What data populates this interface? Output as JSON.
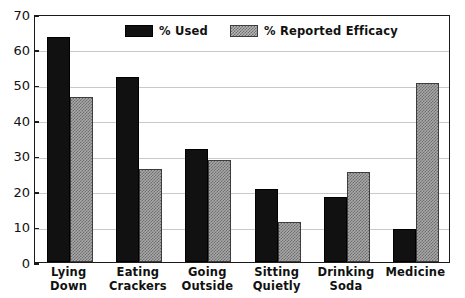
{
  "chart_data": {
    "type": "bar",
    "title": "",
    "subtitle": "",
    "xlabel": "",
    "ylabel": "",
    "ylim": [
      0,
      70
    ],
    "yticks": [
      0,
      10,
      20,
      30,
      40,
      50,
      60,
      70
    ],
    "ytick_labels": [
      "0",
      "10",
      "20",
      "30",
      "40",
      "50",
      "60",
      "70"
    ],
    "grid": true,
    "grid_axis": "y",
    "legend_position": "top-center-inside",
    "categories": [
      "Lying Down",
      "Eating Crackers",
      "Going Outside",
      "Sitting Quietly",
      "Drinking Soda",
      "Medicine"
    ],
    "category_lines": [
      [
        "Lying",
        "Down"
      ],
      [
        "Eating",
        "Crackers"
      ],
      [
        "Going",
        "Outside"
      ],
      [
        "Sitting",
        "Quietly"
      ],
      [
        "Drinking",
        "Soda"
      ],
      [
        "Medicine",
        ""
      ]
    ],
    "series": [
      {
        "name": "% Used",
        "color": "#111111",
        "pattern": "solid",
        "values": [
          63.5,
          52.3,
          32.0,
          20.7,
          18.5,
          9.4
        ]
      },
      {
        "name": "% Reported Efficacy",
        "color": "#a8a8a8",
        "pattern": "crosshatch",
        "values": [
          46.5,
          26.2,
          28.7,
          11.4,
          25.3,
          50.4
        ]
      }
    ],
    "annotations": []
  },
  "legend": {
    "entries": [
      {
        "label": "% Used"
      },
      {
        "label": "% Reported Efficacy"
      }
    ]
  },
  "colors": {
    "axis": "#1a1a1a",
    "grid": "#c9c9c9",
    "background": "#ffffff",
    "series_used": "#111111",
    "series_efficacy": "#a8a8a8"
  }
}
